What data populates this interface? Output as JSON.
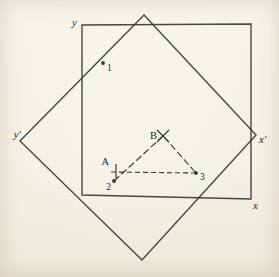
{
  "figure": {
    "colors": {
      "background": "#f3f0e4",
      "line": "#3a3833",
      "text": "#27251f"
    },
    "outer_square": {
      "points": "82,25 251,24 251,199 82,195",
      "axis_labels": [
        {
          "text": "y",
          "x": 77,
          "y": 26,
          "anchor": "end"
        },
        {
          "text": "x",
          "x": 253,
          "y": 209,
          "anchor": "start"
        }
      ]
    },
    "rotated_square": {
      "points": "144,15 256,135 142,260 20,141",
      "axis_labels": [
        {
          "text": "y′",
          "x": 21,
          "y": 138,
          "anchor": "end"
        },
        {
          "text": "x′",
          "x": 259,
          "y": 143,
          "anchor": "start"
        }
      ]
    },
    "dots": [
      {
        "label": "1",
        "x": 103,
        "y": 63,
        "lx": 107,
        "ly": 71,
        "anchor": "start"
      },
      {
        "label": "2",
        "x": 114,
        "y": 181,
        "lx": 111,
        "ly": 190,
        "anchor": "end"
      },
      {
        "label": "3",
        "x": 196,
        "y": 173,
        "lx": 200,
        "ly": 180,
        "anchor": "start"
      }
    ],
    "markers": [
      {
        "type": "cross",
        "label": "B",
        "x": 163,
        "y": 136,
        "size": 6,
        "lx": 157,
        "ly": 139,
        "anchor": "end"
      },
      {
        "type": "tick",
        "label": "A",
        "x": 116,
        "y1": 164,
        "y2": 178,
        "lx": 109,
        "ly": 165,
        "anchor": "end"
      }
    ],
    "dashed_lines": [
      {
        "x1": 111,
        "y1": 172,
        "x2": 195,
        "y2": 173,
        "dash": "5,3"
      },
      {
        "x1": 114,
        "y1": 181,
        "x2": 162,
        "y2": 137,
        "dash": "7,3"
      },
      {
        "x1": 164,
        "y1": 137,
        "x2": 195,
        "y2": 172,
        "dash": "7,3"
      }
    ]
  }
}
